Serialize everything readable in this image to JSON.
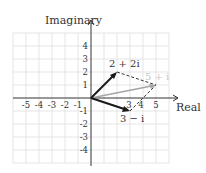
{
  "diagram": {
    "type": "complex-plane-vector-addition",
    "axes": {
      "x_label": "Real",
      "y_label": "Imaginary",
      "x_ticks": [
        "-5",
        "-4",
        "-3",
        "-2",
        "-1",
        "3",
        "4",
        "5"
      ],
      "y_ticks": [
        "4",
        "3",
        "2",
        "1",
        "-1",
        "-2",
        "-3",
        "-4"
      ]
    },
    "vectors": [
      {
        "label": "2 + 2i",
        "from": [
          0,
          0
        ],
        "to": [
          2,
          2
        ],
        "style": "solid-black"
      },
      {
        "label": "3 − i",
        "from": [
          0,
          0
        ],
        "to": [
          3,
          -1
        ],
        "style": "solid-black"
      },
      {
        "label": "5 + i",
        "from": [
          0,
          0
        ],
        "to": [
          5,
          1
        ],
        "style": "solid-gray"
      }
    ],
    "dashed_lines": [
      {
        "from": [
          2,
          2
        ],
        "to": [
          5,
          1
        ]
      },
      {
        "from": [
          3,
          -1
        ],
        "to": [
          5,
          1
        ]
      }
    ],
    "colors": {
      "grid": "#d9d9d9",
      "axis": "#333333",
      "vector": "#1a1a1a",
      "sum_vector": "#a6a6a6"
    }
  }
}
